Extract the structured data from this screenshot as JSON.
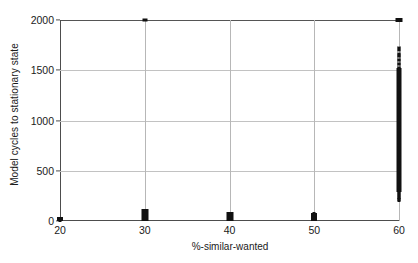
{
  "chart_data": {
    "type": "scatter",
    "title": "",
    "xlabel": "%-similar-wanted",
    "ylabel": "Model cycles to stationary state",
    "xlim": [
      20,
      60
    ],
    "ylim": [
      0,
      2000
    ],
    "xticks": [
      20,
      30,
      40,
      50,
      60
    ],
    "yticks": [
      0,
      500,
      1000,
      1500,
      2000
    ],
    "xtick_labels": [
      "20",
      "30",
      "40",
      "50",
      "60"
    ],
    "ytick_labels": [
      "0",
      "500",
      "1000",
      "1500",
      "2000"
    ],
    "grid": true,
    "legend": "none",
    "marker_color": "#111111",
    "axis_color": "#4d4d4d",
    "grid_color": "#c2c2c2",
    "series": [
      {
        "name": "runs",
        "points": [
          {
            "x": 20,
            "y": 2
          },
          {
            "x": 20,
            "y": 6
          },
          {
            "x": 20,
            "y": 9
          },
          {
            "x": 20,
            "y": 12
          },
          {
            "x": 20,
            "y": 16
          },
          {
            "x": 20,
            "y": 20
          },
          {
            "x": 20,
            "y": 25
          },
          {
            "x": 20,
            "y": 30
          },
          {
            "x": 30,
            "y": 5
          },
          {
            "x": 30,
            "y": 12
          },
          {
            "x": 30,
            "y": 18
          },
          {
            "x": 30,
            "y": 24
          },
          {
            "x": 30,
            "y": 31
          },
          {
            "x": 30,
            "y": 38
          },
          {
            "x": 30,
            "y": 45
          },
          {
            "x": 30,
            "y": 52
          },
          {
            "x": 30,
            "y": 60
          },
          {
            "x": 30,
            "y": 68
          },
          {
            "x": 30,
            "y": 75
          },
          {
            "x": 30,
            "y": 84
          },
          {
            "x": 30,
            "y": 92
          },
          {
            "x": 30,
            "y": 100
          },
          {
            "x": 30,
            "y": 110
          },
          {
            "x": 30,
            "y": 2000
          },
          {
            "x": 40,
            "y": 6
          },
          {
            "x": 40,
            "y": 13
          },
          {
            "x": 40,
            "y": 20
          },
          {
            "x": 40,
            "y": 27
          },
          {
            "x": 40,
            "y": 34
          },
          {
            "x": 40,
            "y": 41
          },
          {
            "x": 40,
            "y": 48
          },
          {
            "x": 40,
            "y": 56
          },
          {
            "x": 40,
            "y": 64
          },
          {
            "x": 40,
            "y": 72
          },
          {
            "x": 40,
            "y": 80
          },
          {
            "x": 50,
            "y": 8
          },
          {
            "x": 50,
            "y": 16
          },
          {
            "x": 50,
            "y": 24
          },
          {
            "x": 50,
            "y": 32
          },
          {
            "x": 50,
            "y": 40
          },
          {
            "x": 50,
            "y": 48
          },
          {
            "x": 50,
            "y": 57
          },
          {
            "x": 50,
            "y": 66
          },
          {
            "x": 50,
            "y": 75
          },
          {
            "x": 60,
            "y": 200
          },
          {
            "x": 60,
            "y": 215
          },
          {
            "x": 60,
            "y": 230
          },
          {
            "x": 60,
            "y": 250
          },
          {
            "x": 60,
            "y": 268
          },
          {
            "x": 60,
            "y": 290
          },
          {
            "x": 60,
            "y": 320
          },
          {
            "x": 60,
            "y": 350
          },
          {
            "x": 60,
            "y": 380
          },
          {
            "x": 60,
            "y": 410
          },
          {
            "x": 60,
            "y": 440
          },
          {
            "x": 60,
            "y": 470
          },
          {
            "x": 60,
            "y": 500
          },
          {
            "x": 60,
            "y": 530
          },
          {
            "x": 60,
            "y": 560
          },
          {
            "x": 60,
            "y": 590
          },
          {
            "x": 60,
            "y": 620
          },
          {
            "x": 60,
            "y": 650
          },
          {
            "x": 60,
            "y": 680
          },
          {
            "x": 60,
            "y": 710
          },
          {
            "x": 60,
            "y": 740
          },
          {
            "x": 60,
            "y": 770
          },
          {
            "x": 60,
            "y": 800
          },
          {
            "x": 60,
            "y": 830
          },
          {
            "x": 60,
            "y": 860
          },
          {
            "x": 60,
            "y": 890
          },
          {
            "x": 60,
            "y": 920
          },
          {
            "x": 60,
            "y": 950
          },
          {
            "x": 60,
            "y": 980
          },
          {
            "x": 60,
            "y": 1010
          },
          {
            "x": 60,
            "y": 1040
          },
          {
            "x": 60,
            "y": 1070
          },
          {
            "x": 60,
            "y": 1100
          },
          {
            "x": 60,
            "y": 1130
          },
          {
            "x": 60,
            "y": 1160
          },
          {
            "x": 60,
            "y": 1190
          },
          {
            "x": 60,
            "y": 1220
          },
          {
            "x": 60,
            "y": 1250
          },
          {
            "x": 60,
            "y": 1280
          },
          {
            "x": 60,
            "y": 1310
          },
          {
            "x": 60,
            "y": 1340
          },
          {
            "x": 60,
            "y": 1370
          },
          {
            "x": 60,
            "y": 1400
          },
          {
            "x": 60,
            "y": 1430
          },
          {
            "x": 60,
            "y": 1460
          },
          {
            "x": 60,
            "y": 1490
          },
          {
            "x": 60,
            "y": 1520
          },
          {
            "x": 60,
            "y": 1560
          },
          {
            "x": 60,
            "y": 1600
          },
          {
            "x": 60,
            "y": 1640
          },
          {
            "x": 60,
            "y": 1660
          },
          {
            "x": 60,
            "y": 1700
          },
          {
            "x": 60,
            "y": 1720
          },
          {
            "x": 60,
            "y": 2000
          }
        ]
      }
    ],
    "clusters": [
      {
        "x": 20,
        "y_min": 0,
        "y_max": 35,
        "width_px": 6,
        "opacity": 1
      },
      {
        "x": 30,
        "y_min": 0,
        "y_max": 115,
        "width_px": 7,
        "opacity": 1
      },
      {
        "x": 40,
        "y_min": 0,
        "y_max": 85,
        "width_px": 7,
        "opacity": 1
      },
      {
        "x": 50,
        "y_min": 0,
        "y_max": 80,
        "width_px": 6,
        "opacity": 1
      },
      {
        "x": 60,
        "y_min": 290,
        "y_max": 1520,
        "width_px": 5,
        "opacity": 1
      },
      {
        "x": 60,
        "y_min": 1520,
        "y_max": 1660,
        "width_px": 4,
        "opacity": 0.55
      },
      {
        "x": 60,
        "y_min": 1660,
        "y_max": 1740,
        "width_px": 4,
        "opacity": 0.4
      },
      {
        "x": 60,
        "y_min": 200,
        "y_max": 290,
        "width_px": 4,
        "opacity": 0.5
      }
    ],
    "cap_markers": [
      {
        "x": 30,
        "y": 2000,
        "w": 5,
        "h": 3
      },
      {
        "x": 60,
        "y": 2000,
        "w": 7,
        "h": 4
      }
    ]
  }
}
